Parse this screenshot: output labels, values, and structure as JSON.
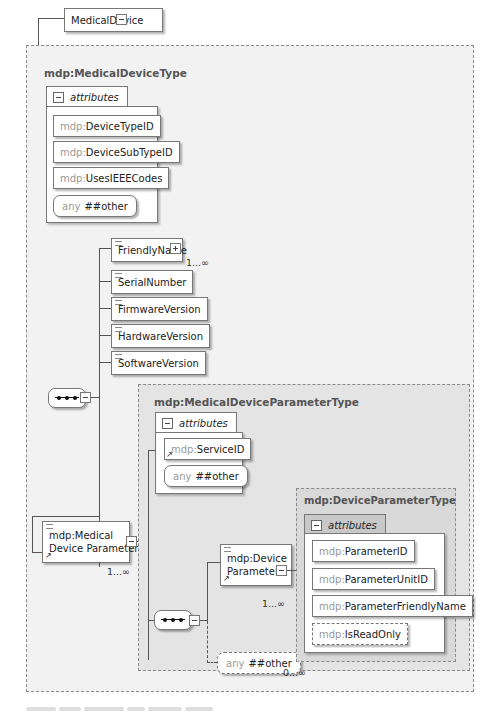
{
  "diagram": {
    "root_element": "MedicalDevice",
    "medical_device_type": {
      "title": "mdp:MedicalDeviceType",
      "attributes_label": "attributes",
      "attributes": [
        {
          "ns": "mdp:",
          "name": "DeviceTypeID"
        },
        {
          "ns": "mdp:",
          "name": "DeviceSubTypeID"
        },
        {
          "ns": "mdp:",
          "name": "UsesIEEECodes"
        }
      ],
      "any_attr": {
        "kw": "any",
        "value": "##other"
      },
      "sequence_children": [
        {
          "name": "FriendlyName",
          "cardinality": "1...∞",
          "expandable": true
        },
        {
          "name": "SerialNumber"
        },
        {
          "name": "FirmwareVersion"
        },
        {
          "name": "HardwareVersion"
        },
        {
          "name": "SoftwareVersion"
        }
      ],
      "param_element": {
        "line1": "mdp:Medical",
        "line2": "Device Parameter",
        "cardinality": "1...∞"
      }
    },
    "medical_device_parameter_type": {
      "title": "mdp:MedicalDeviceParameterType",
      "attributes_label": "attributes",
      "attributes": [
        {
          "ns": "mdp:",
          "name": "ServiceID"
        }
      ],
      "any_attr": {
        "kw": "any",
        "value": "##other"
      },
      "device_param_element": {
        "line1": "mdp:Device",
        "line2": "Parameter",
        "cardinality": "1...∞"
      },
      "any_element": {
        "kw": "any",
        "value": "##other",
        "cardinality": "0...∞"
      }
    },
    "device_parameter_type": {
      "title": "mdp:DeviceParameterType",
      "attributes_label": "attributes",
      "attributes": [
        {
          "ns": "mdp:",
          "name": "ParameterID"
        },
        {
          "ns": "mdp:",
          "name": "ParameterUnitID"
        },
        {
          "ns": "mdp:",
          "name": "ParameterFriendlyName"
        },
        {
          "ns": "mdp:",
          "name": "IsReadOnly"
        }
      ]
    }
  }
}
